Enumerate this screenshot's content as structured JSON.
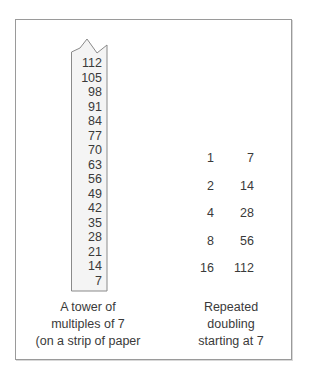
{
  "figure": {
    "tower": {
      "values": [
        "112",
        "105",
        "98",
        "91",
        "84",
        "77",
        "70",
        "63",
        "56",
        "49",
        "42",
        "35",
        "28",
        "21",
        "14",
        "7"
      ],
      "caption_lines": [
        "A tower of",
        "multiples of 7",
        "(on a strip of paper"
      ]
    },
    "doubling": {
      "rows": [
        {
          "factor": "1",
          "value": "7"
        },
        {
          "factor": "2",
          "value": "14"
        },
        {
          "factor": "4",
          "value": "28"
        },
        {
          "factor": "8",
          "value": "56"
        },
        {
          "factor": "16",
          "value": "112"
        }
      ],
      "caption_lines": [
        "Repeated",
        "doubling",
        "starting at 7"
      ]
    },
    "colors": {
      "text": "#3a3a3a",
      "border": "#9a9a9a",
      "strip_fill": "#f4f4f4"
    }
  }
}
